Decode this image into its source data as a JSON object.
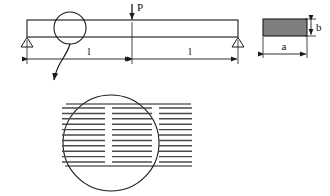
{
  "figure": {
    "background_color": "#ffffff",
    "line_color": "#1a1a1a"
  },
  "labels": {
    "load": "P",
    "span_left": "l",
    "span_right": "l",
    "section_width": "a",
    "section_height": "b"
  },
  "beam": {
    "name": "simply-supported-beam",
    "x_left": 27,
    "x_right": 238,
    "y_top": 20,
    "y_bottom": 37,
    "fill": "#ffffff"
  },
  "load": {
    "name": "point-load-P",
    "x": 132,
    "arrow_top_y": 4,
    "arrow_tip_y": 20,
    "label_x": 137,
    "label_y": 10
  },
  "supports": [
    {
      "name": "support-left-pin",
      "x": 27,
      "y": 37,
      "half_width": 6,
      "height": 10
    },
    {
      "name": "support-right-pin",
      "x": 238,
      "y": 37,
      "half_width": 6,
      "height": 10
    }
  ],
  "dimensions": [
    {
      "name": "dimension-span-left",
      "label": "l",
      "x_start": 27,
      "x_end": 132,
      "y": 59,
      "label_x": 89,
      "label_y": 54
    },
    {
      "name": "dimension-span-right",
      "label": "l",
      "x_start": 132,
      "x_end": 238,
      "y": 59,
      "label_x": 190,
      "label_y": 54
    },
    {
      "name": "dimension-section-width",
      "label": "a",
      "x_start": 263,
      "x_end": 307,
      "y": 54,
      "label_x": 284,
      "label_y": 49
    },
    {
      "name": "dimension-section-height",
      "label": "b",
      "x": 311,
      "y_start": 19,
      "y_end": 36,
      "label_x": 317,
      "label_y": 31
    }
  ],
  "cross_section": {
    "name": "cross-section-rectangle",
    "x": 263,
    "y": 19,
    "width": 44,
    "height": 17,
    "fill_color": "#7f7f7f",
    "stroke_color": "#1a1a1a"
  },
  "detail_callout": {
    "name": "detail-callout-circle-small",
    "cx": 70,
    "cy": 28,
    "r": 16
  },
  "leader": {
    "name": "detail-leader-arrow",
    "path": "M 70 44 C 66 58, 56 64, 54 80",
    "arrow_x": 54,
    "arrow_y": 86
  },
  "detail_view": {
    "name": "laminate-detail-magnified",
    "cx": 111,
    "cy": 143,
    "r": 48,
    "top_line_y": 104,
    "bottom_line_y": 166,
    "columns": [
      {
        "name": "laminate-column-left",
        "x_start": 62,
        "x_end": 105
      },
      {
        "name": "laminate-column-middle",
        "x_start": 112,
        "x_end": 152
      },
      {
        "name": "laminate-column-right",
        "x_start": 159,
        "x_end": 192
      }
    ],
    "layer_count": 11,
    "layer_y_start": 108,
    "layer_spacing": 5.4,
    "layer_color": "#4a4a4a"
  }
}
